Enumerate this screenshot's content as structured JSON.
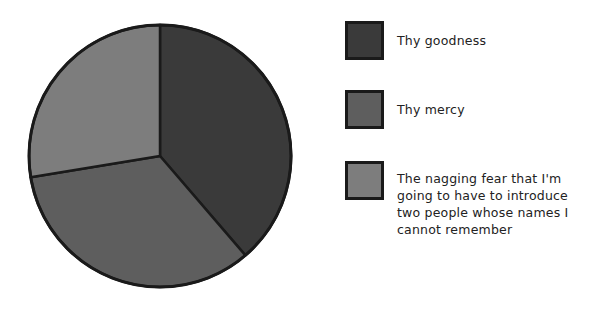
{
  "chart_data": {
    "type": "pie",
    "title": "",
    "categories": [
      "Thy goodness",
      "Thy mercy",
      "The nagging fear that I'm going to have to introduce two people whose names I cannot remember"
    ],
    "values": [
      38.7,
      33.7,
      27.6
    ],
    "unit": "percent (estimated from slice angles)",
    "colors": [
      "#3a3a3a",
      "#5e5e5e",
      "#7d7d7d"
    ],
    "start_angle": "12 o'clock, clockwise",
    "legend_position": "right",
    "slice_border_color": "#1a1a1a"
  },
  "legend": {
    "items": [
      {
        "label": "Thy goodness",
        "color": "#3a3a3a"
      },
      {
        "label": "Thy mercy",
        "color": "#5e5e5e"
      },
      {
        "label": "The nagging fear that I'm going to have to introduce two people whose names I cannot remember",
        "color": "#7d7d7d"
      }
    ]
  }
}
